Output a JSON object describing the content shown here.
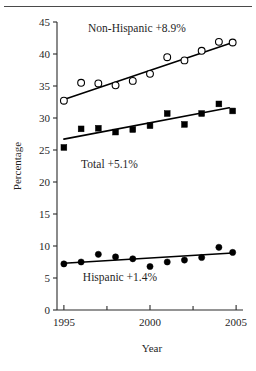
{
  "figure": {
    "has_top_rule": true,
    "background": "#ffffff",
    "ink_color": "#000000"
  },
  "chart_data": {
    "type": "scatter",
    "title": "",
    "xlabel": "Year",
    "ylabel": "Percentage",
    "xlim": [
      1994.6,
      2005.4
    ],
    "ylim": [
      0,
      45
    ],
    "xticks": [
      1995,
      2000,
      2005
    ],
    "xtick_labels": [
      "1995",
      "2000",
      "2005"
    ],
    "xminor_ticks": [
      1997.5,
      2002.5
    ],
    "yticks": [
      0,
      5,
      10,
      15,
      20,
      25,
      30,
      35,
      40,
      45
    ],
    "ytick_labels": [
      "0",
      "5",
      "10",
      "15",
      "20",
      "25",
      "30",
      "35",
      "40",
      "45"
    ],
    "grid": false,
    "legend": "inline-annotations",
    "series": [
      {
        "name": "Non-Hispanic",
        "marker": "open-circle",
        "annotation": "Non-Hispanic +8.9%",
        "annotation_x": 1996.4,
        "annotation_y": 43.4,
        "x": [
          1995.0,
          1996.0,
          1997.0,
          1998.0,
          1999.0,
          2000.0,
          2001.0,
          2002.0,
          2003.0,
          2004.0,
          2004.8
        ],
        "values": [
          32.7,
          35.5,
          35.4,
          35.1,
          35.8,
          36.9,
          39.5,
          39.0,
          40.5,
          41.9,
          41.8
        ],
        "trend_start": [
          1995.0,
          32.9
        ],
        "trend_end": [
          2004.8,
          41.8
        ],
        "trend_change": "+8.9%"
      },
      {
        "name": "Total",
        "marker": "filled-square",
        "annotation": "Total +5.1%",
        "annotation_x": 1996.0,
        "annotation_y": 22.2,
        "x": [
          1995.0,
          1996.0,
          1997.0,
          1998.0,
          1999.0,
          2000.0,
          2001.0,
          2002.0,
          2003.0,
          2004.0,
          2004.8
        ],
        "values": [
          25.4,
          28.3,
          28.4,
          27.8,
          28.2,
          28.8,
          30.7,
          29.0,
          30.7,
          32.2,
          31.1
        ],
        "trend_start": [
          1995.0,
          26.7
        ],
        "trend_end": [
          2004.6,
          31.6
        ],
        "trend_change": "+5.1%"
      },
      {
        "name": "Hispanic",
        "marker": "filled-circle",
        "annotation": "Hispanic +1.4%",
        "annotation_x": 1996.1,
        "annotation_y": 4.6,
        "x": [
          1995.0,
          1996.0,
          1997.0,
          1998.0,
          1999.0,
          2000.0,
          2001.0,
          2002.0,
          2003.0,
          2004.0,
          2004.8
        ],
        "values": [
          7.2,
          7.5,
          8.7,
          8.3,
          8.0,
          6.8,
          7.5,
          7.8,
          8.2,
          9.8,
          9.0
        ],
        "trend_start": [
          1995.0,
          7.3
        ],
        "trend_end": [
          2004.8,
          8.9
        ],
        "trend_change": "+1.4%"
      }
    ]
  }
}
